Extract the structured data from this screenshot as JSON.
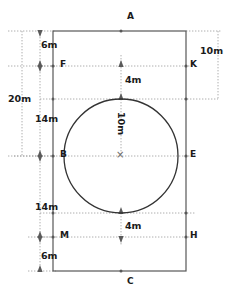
{
  "diagram": {
    "type": "engineering-dimension-drawing",
    "colors": {
      "outline": "#4a4a4a",
      "circle": "#3a3a3a",
      "dimension_line": "#8a8a8a",
      "text": "#1a1a1a",
      "background": "#ffffff"
    },
    "point_labels": [
      {
        "id": "A",
        "text": "A",
        "x": 127,
        "y": 17
      },
      {
        "id": "F",
        "text": "F",
        "x": 58,
        "y": 61
      },
      {
        "id": "K",
        "text": "K",
        "x": 190,
        "y": 61
      },
      {
        "id": "B",
        "text": "B",
        "x": 58,
        "y": 151
      },
      {
        "id": "E",
        "text": "E",
        "x": 190,
        "y": 151
      },
      {
        "id": "M",
        "text": "M",
        "x": 58,
        "y": 232
      },
      {
        "id": "H",
        "text": "H",
        "x": 190,
        "y": 232
      },
      {
        "id": "C",
        "text": "C",
        "x": 127,
        "y": 278
      },
      {
        "id": "X",
        "text": "×",
        "x": 117,
        "y": 150
      }
    ],
    "dimension_labels": [
      {
        "id": "top-gap",
        "text": "6m",
        "x": 42,
        "y": 41
      },
      {
        "id": "right-depth",
        "text": "10m",
        "x": 200,
        "y": 47
      },
      {
        "id": "total-height",
        "text": "20m",
        "x": 10,
        "y": 95
      },
      {
        "id": "upper-radius",
        "text": "14m",
        "x": 35,
        "y": 115
      },
      {
        "id": "top-clearance",
        "text": "4m",
        "x": 126,
        "y": 76
      },
      {
        "id": "radius-vertical",
        "text": "10m",
        "x": 117,
        "y": 115,
        "rotated": true
      },
      {
        "id": "lower-radius",
        "text": "14m",
        "x": 35,
        "y": 203
      },
      {
        "id": "bottom-clearance",
        "text": "4m",
        "x": 126,
        "y": 222
      },
      {
        "id": "bottom-gap",
        "text": "6m",
        "x": 42,
        "y": 252
      }
    ],
    "geometry": {
      "rect_left": 53,
      "rect_right": 186,
      "rect_top": 31,
      "rect_bottom": 271,
      "circle_cx": 121,
      "circle_cy": 156,
      "circle_r": 57,
      "line_fk_y": 66,
      "line_be_y": 156,
      "line_mh_y": 237
    }
  }
}
